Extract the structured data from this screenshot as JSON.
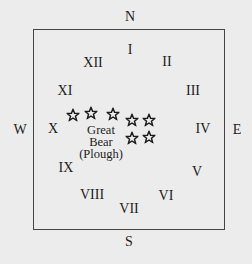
{
  "compass": {
    "north": "N",
    "south": "S",
    "east": "E",
    "west": "W"
  },
  "hours": [
    "I",
    "II",
    "III",
    "IV",
    "V",
    "VI",
    "VII",
    "VIII",
    "IX",
    "X",
    "XI",
    "XII"
  ],
  "constellation": {
    "line1": "Great",
    "line2": "Bear",
    "line3": "(Plough)",
    "star_count": 7
  },
  "colors": {
    "background": "#ececec",
    "ink": "#1c1c1c",
    "frame": "#444444"
  }
}
